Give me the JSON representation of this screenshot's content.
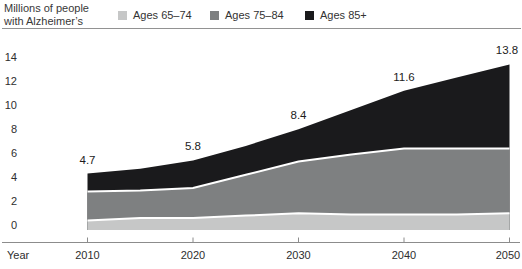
{
  "header": {
    "title_line1": "Millions of people",
    "title_line2": "with Alzheimer’s"
  },
  "legend": {
    "items": [
      {
        "label": "Ages 65–74",
        "color": "#c6c7c7"
      },
      {
        "label": "Ages 75–84",
        "color": "#7e8081"
      },
      {
        "label": "Ages 85+",
        "color": "#1a1a1c"
      }
    ]
  },
  "chart_data": {
    "type": "area",
    "stacked": true,
    "title": "Millions of people with Alzheimer’s",
    "x": [
      2010,
      2015,
      2020,
      2025,
      2030,
      2035,
      2040,
      2045,
      2050
    ],
    "series": [
      {
        "name": "Ages 65–74",
        "color": "#c6c7c7",
        "values": [
          0.8,
          1.0,
          1.0,
          1.2,
          1.4,
          1.3,
          1.3,
          1.3,
          1.4
        ]
      },
      {
        "name": "Ages 75–84",
        "color": "#7e8081",
        "values": [
          2.4,
          2.3,
          2.5,
          3.4,
          4.3,
          5.0,
          5.5,
          5.5,
          5.4
        ]
      },
      {
        "name": "Ages 85+",
        "color": "#1a1a1c",
        "values": [
          1.5,
          1.8,
          2.3,
          2.4,
          2.7,
          3.7,
          4.8,
          5.9,
          7.0
        ]
      }
    ],
    "point_labels": [
      {
        "x": 2010,
        "total": 4.7,
        "label": "4.7"
      },
      {
        "x": 2020,
        "total": 5.8,
        "label": "5.8"
      },
      {
        "x": 2030,
        "total": 8.4,
        "label": "8.4"
      },
      {
        "x": 2040,
        "total": 11.6,
        "label": "11.6"
      },
      {
        "x": 2050,
        "total": 13.8,
        "label": "13.8"
      }
    ],
    "xlabel": "Year",
    "xticks": [
      2010,
      2020,
      2030,
      2040,
      2050
    ],
    "yticks": [
      0,
      2,
      4,
      6,
      8,
      10,
      12,
      14
    ],
    "ylim": [
      0,
      14
    ],
    "grid": false,
    "legend_position": "top",
    "separator_color": "#ffffff",
    "axis_color": "#8c8c8c",
    "tick_text_color": "#2e2e2e",
    "label_text_color": "#1c1c1c"
  }
}
